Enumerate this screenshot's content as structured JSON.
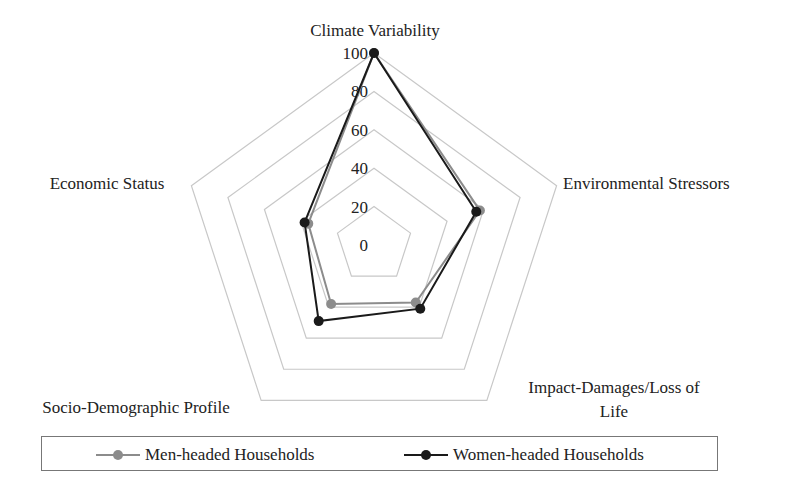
{
  "chart_data": {
    "type": "radar",
    "title": "",
    "axes": [
      "Climate Variability",
      "Environmental Stressors",
      "Impact-Damages/Loss of Life",
      "Socio-Demographic Profile",
      "Economic Status"
    ],
    "axis_label_lines": [
      [
        "Climate Variability"
      ],
      [
        "Environmental Stressors"
      ],
      [
        "Impact-Damages/Loss of",
        "Life"
      ],
      [
        "Socio-Demographic Profile"
      ],
      [
        "Economic Status"
      ]
    ],
    "rlim": [
      0,
      100
    ],
    "ticks": [
      0,
      20,
      40,
      60,
      80,
      100
    ],
    "tick_labels": [
      "0",
      "20",
      "40",
      "60",
      "80",
      "100"
    ],
    "grid": true,
    "legend_position": "bottom",
    "series": [
      {
        "name": "Men-headed Households",
        "color": "#8c8c8c",
        "values": [
          100,
          58,
          37,
          38,
          36
        ]
      },
      {
        "name": "Women-headed Households",
        "color": "#1a1a1a",
        "values": [
          100,
          56,
          41,
          49,
          38
        ]
      }
    ]
  },
  "legend": {
    "items": [
      {
        "label": "Men-headed Households",
        "color": "#8c8c8c"
      },
      {
        "label": "Women-headed Households",
        "color": "#1a1a1a"
      }
    ]
  },
  "colors": {
    "grid": "#c8c8c8",
    "background": "#ffffff",
    "text": "#222222"
  }
}
